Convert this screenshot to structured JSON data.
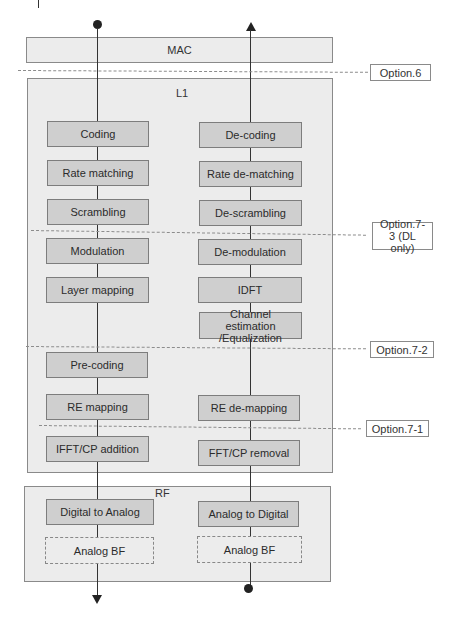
{
  "layers": {
    "mac": "MAC",
    "l1": "L1",
    "rf": "RF"
  },
  "tx_chain": {
    "l1_blocks": [
      "Coding",
      "Rate matching",
      "Scrambling",
      "Modulation",
      "Layer mapping",
      "Pre-coding",
      "RE mapping",
      "IFFT/CP addition"
    ],
    "rf_blocks": [
      "Digital to Analog",
      "Analog BF"
    ]
  },
  "rx_chain": {
    "l1_blocks": [
      "De-coding",
      "Rate de-matching",
      "De-scrambling",
      "De-modulation",
      "IDFT",
      "Channel estimation /Equalization",
      "RE de-mapping",
      "FFT/CP removal"
    ],
    "rf_blocks": [
      "Analog to Digital",
      "Analog BF"
    ]
  },
  "split_options": [
    {
      "label": "Option.6"
    },
    {
      "label": "Option.7-3 (DL only)"
    },
    {
      "label": "Option.7-2"
    },
    {
      "label": "Option.7-1"
    }
  ],
  "colors": {
    "layer_fill": "#ececec",
    "block_fill": "#cfcfcf",
    "border": "#7d7d7d",
    "line": "#333333"
  }
}
